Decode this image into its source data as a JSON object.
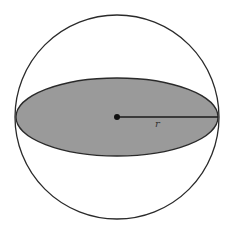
{
  "diagram": {
    "type": "sphere-cross-section",
    "colors": {
      "background": "#ffffff",
      "stroke": "#2a2a2a",
      "cross_section_fill": "#9a9a9a"
    },
    "sphere": {
      "cx": 117,
      "cy": 117,
      "r": 102
    },
    "cross_section": {
      "cx": 117,
      "cy": 117,
      "rx": 101,
      "ry": 39
    },
    "center_point": {
      "cx": 117,
      "cy": 117
    },
    "radius_line": {
      "x1": 117,
      "y1": 117,
      "x2": 218,
      "y2": 117
    },
    "radius_label": {
      "text": "r",
      "x": 155,
      "y": 127
    }
  }
}
